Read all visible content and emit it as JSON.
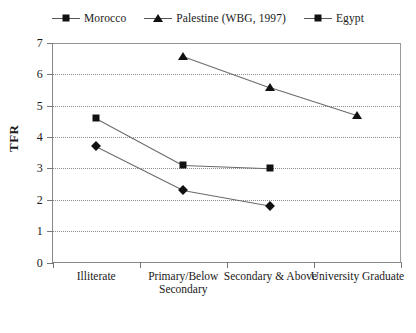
{
  "chart_data": {
    "type": "line",
    "title": "",
    "xlabel": "",
    "ylabel": "TFR",
    "ylim": [
      0,
      7
    ],
    "yticks": [
      0,
      1,
      2,
      3,
      4,
      5,
      6,
      7
    ],
    "grid": true,
    "legend_position": "top",
    "categories": [
      "Illiterate",
      "Primary/Below Secondary",
      "Secondary & Above",
      "University Graduate"
    ],
    "series": [
      {
        "name": "Morocco",
        "marker": "diamond",
        "values": [
          3.7,
          2.3,
          1.8,
          null
        ]
      },
      {
        "name": "Palestine (WBG, 1997)",
        "marker": "triangle",
        "values": [
          null,
          6.6,
          5.6,
          4.7
        ]
      },
      {
        "name": "Egypt",
        "marker": "square",
        "values": [
          4.6,
          3.1,
          3.0,
          null
        ]
      }
    ]
  },
  "legend": {
    "items": [
      {
        "label": "Morocco",
        "marker": "diamond-marker"
      },
      {
        "label": "Palestine (WBG, 1997)",
        "marker": "triangle-marker"
      },
      {
        "label": "Egypt",
        "marker": "square-marker"
      }
    ]
  },
  "axes": {
    "y_title": "TFR",
    "y_tick_labels": [
      "7",
      "6",
      "5",
      "4",
      "3",
      "2",
      "1",
      "0"
    ],
    "x_tick_labels": [
      "Illiterate",
      "Primary/Below Secondary",
      "Secondary & Above",
      "University Graduate"
    ]
  },
  "colors": {
    "marker": "#111111",
    "line": "#6a6a6a",
    "grid": "#8c8c8c",
    "axis": "#777777",
    "text": "#1a1a1a"
  }
}
